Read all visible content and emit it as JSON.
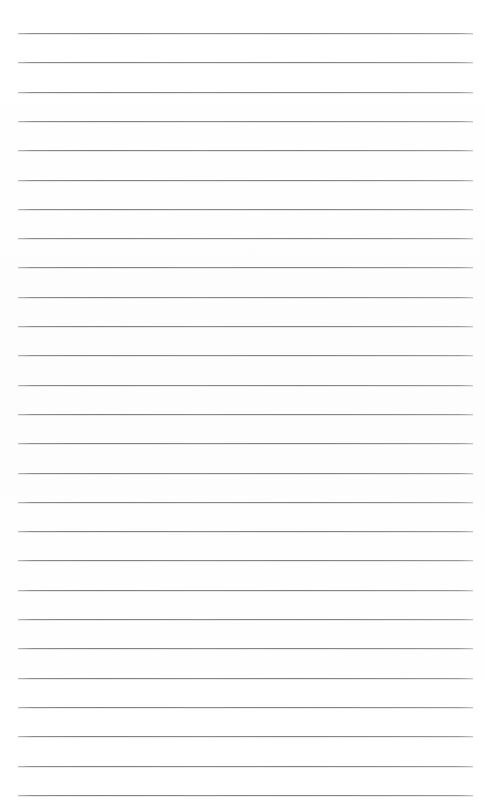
{
  "document": {
    "kind": "lined-notepad-page",
    "title": "",
    "body_text": "",
    "header_text": "",
    "footer_text": "",
    "page_number": "",
    "is_blank": true
  },
  "page": {
    "width": 485,
    "height": 808,
    "background_color": "#fefefe"
  },
  "ruling": {
    "line_color": "#8a8a8a",
    "line_thickness": 1,
    "line_count": 27,
    "first_line_y": 33,
    "line_pitch": 29.3,
    "left_x": 18,
    "right_x": 473,
    "line_length": 455,
    "lines_y": [
      33,
      62.3,
      91.6,
      120.9,
      150.2,
      179.5,
      208.8,
      238.1,
      267.4,
      296.7,
      326,
      355.3,
      384.6,
      413.9,
      443.2,
      472.5,
      501.8,
      531.1,
      560.4,
      589.7,
      619,
      648.3,
      677.6,
      706.9,
      736.2,
      765.5,
      794.8
    ]
  }
}
